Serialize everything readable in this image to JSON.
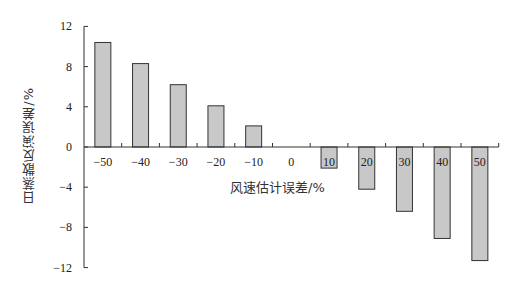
{
  "chart_data": {
    "type": "bar",
    "title": "",
    "xlabel": "风速估计误差/%",
    "ylabel": "日蒸散反演误差/%",
    "categories": [
      "-50",
      "-40",
      "-30",
      "-20",
      "-10",
      "0",
      "10",
      "20",
      "30",
      "40",
      "50"
    ],
    "values": [
      10.4,
      8.3,
      6.2,
      4.1,
      2.1,
      0,
      -2.1,
      -4.2,
      -6.4,
      -9.1,
      -11.3
    ],
    "ylim": [
      -12,
      12
    ],
    "yticks": [
      "12",
      "8",
      "4",
      "0",
      "-4",
      "-8",
      "-12"
    ],
    "ytick_values": [
      12,
      8,
      4,
      0,
      -4,
      -8,
      -12
    ],
    "grid": false,
    "legend": null,
    "bar_color": "#c8c8c8",
    "bar_edge_color": "#333333"
  }
}
